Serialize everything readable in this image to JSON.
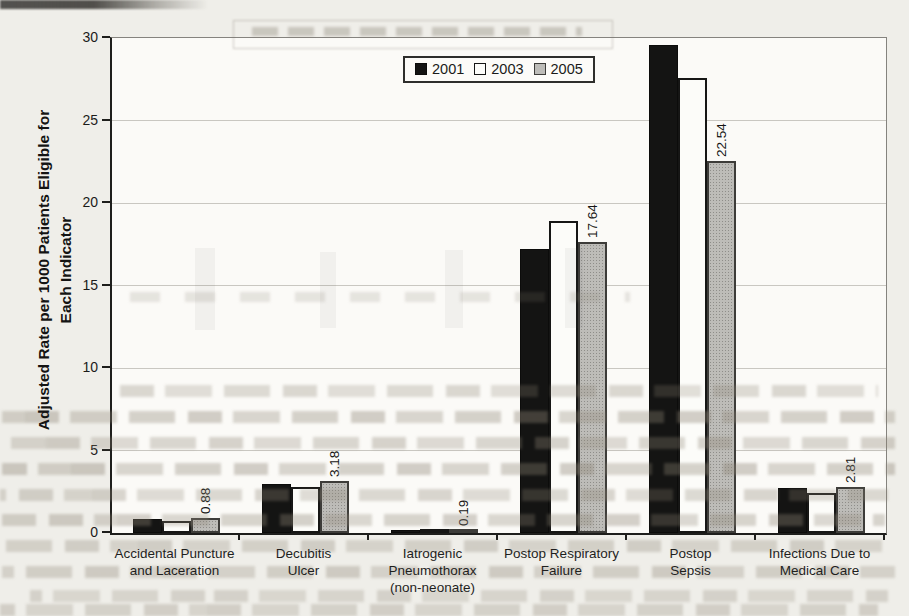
{
  "figure": {
    "y_axis_title_line1": "Adjusted Rate per 1000 Patients Eligible for",
    "y_axis_title_line2": "Each Indicator"
  },
  "legend": {
    "items": [
      {
        "label": "2001",
        "color": "#141413",
        "swatch": "black-filled-square-icon"
      },
      {
        "label": "2003",
        "color": "#fcfcf9",
        "swatch": "white-square-icon"
      },
      {
        "label": "2005",
        "color": "#bdbcb8",
        "swatch": "gray-stippled-square-icon"
      }
    ]
  },
  "chart_data": {
    "type": "bar",
    "title": "",
    "ylabel": "Adjusted Rate per 1000 Patients Eligible for Each Indicator",
    "xlabel": "",
    "ylim": [
      0,
      30
    ],
    "yticks": [
      0,
      5,
      10,
      15,
      20,
      25,
      30
    ],
    "grid": "horizontal",
    "legend_position": "top-center-inside",
    "categories": [
      "Accidental Puncture and Laceration",
      "Decubitis Ulcer",
      "Iatrogenic Pneumothorax (non-neonate)",
      "Postop Respiratory Failure",
      "Postop Sepsis",
      "Infections Due to Medical Care"
    ],
    "category_label_lines": [
      [
        "Accidental Puncture",
        "and Laceration"
      ],
      [
        "Decubitis",
        "Ulcer"
      ],
      [
        "Iatrogenic",
        "Pneumothorax",
        "(non-neonate)"
      ],
      [
        "Postop Respiratory",
        "Failure"
      ],
      [
        "Postop",
        "Sepsis"
      ],
      [
        "Infections Due to",
        "Medical Care"
      ]
    ],
    "series": [
      {
        "name": "2001",
        "color": "#141413",
        "values": [
          0.85,
          3.0,
          0.2,
          17.2,
          29.6,
          2.75
        ]
      },
      {
        "name": "2003",
        "color": "#fcfcf9",
        "values": [
          0.75,
          2.8,
          0.17,
          18.9,
          27.6,
          2.45
        ]
      },
      {
        "name": "2005",
        "color": "#bdbcb8",
        "values": [
          0.88,
          3.18,
          0.19,
          17.64,
          22.54,
          2.81
        ],
        "data_labels": [
          "0.88",
          "3.18",
          "0.19",
          "17.64",
          "22.54",
          "2.81"
        ]
      }
    ]
  }
}
